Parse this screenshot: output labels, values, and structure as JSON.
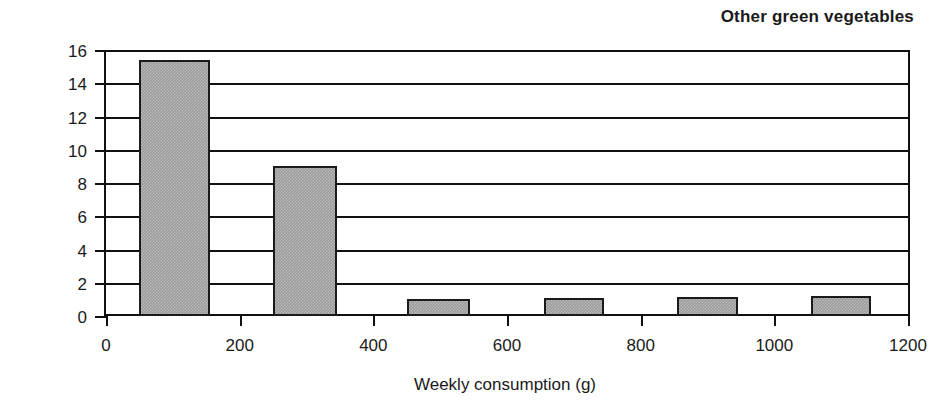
{
  "chart_data": {
    "type": "bar",
    "title": "Other green vegetables",
    "xlabel": "Weekly consumption (g)",
    "ylabel": "Number of people",
    "xlim": [
      0,
      1200
    ],
    "ylim": [
      0,
      16
    ],
    "grid": true,
    "legend": "none",
    "xticks": [
      "0",
      "200",
      "400",
      "600",
      "800",
      "1000",
      "1200"
    ],
    "xtick_values": [
      0,
      200,
      400,
      600,
      800,
      1000,
      1200
    ],
    "yticks": [
      "0",
      "2",
      "4",
      "6",
      "8",
      "10",
      "12",
      "14",
      "16"
    ],
    "ytick_values": [
      0,
      2,
      4,
      6,
      8,
      10,
      12,
      14,
      16
    ],
    "bars": [
      {
        "x_start": 50,
        "x_end": 155,
        "value": 15.4
      },
      {
        "x_start": 250,
        "x_end": 345,
        "value": 9.0
      },
      {
        "x_start": 450,
        "x_end": 545,
        "value": 1.05
      },
      {
        "x_start": 655,
        "x_end": 745,
        "value": 1.1
      },
      {
        "x_start": 855,
        "x_end": 945,
        "value": 1.15
      },
      {
        "x_start": 1055,
        "x_end": 1145,
        "value": 1.2
      }
    ],
    "colors": {
      "bar_fill": "#9a9a9a",
      "bar_edge": "#1a1a1a",
      "axis": "#111111",
      "background": "#ffffff",
      "text": "#1a1a1a"
    }
  }
}
